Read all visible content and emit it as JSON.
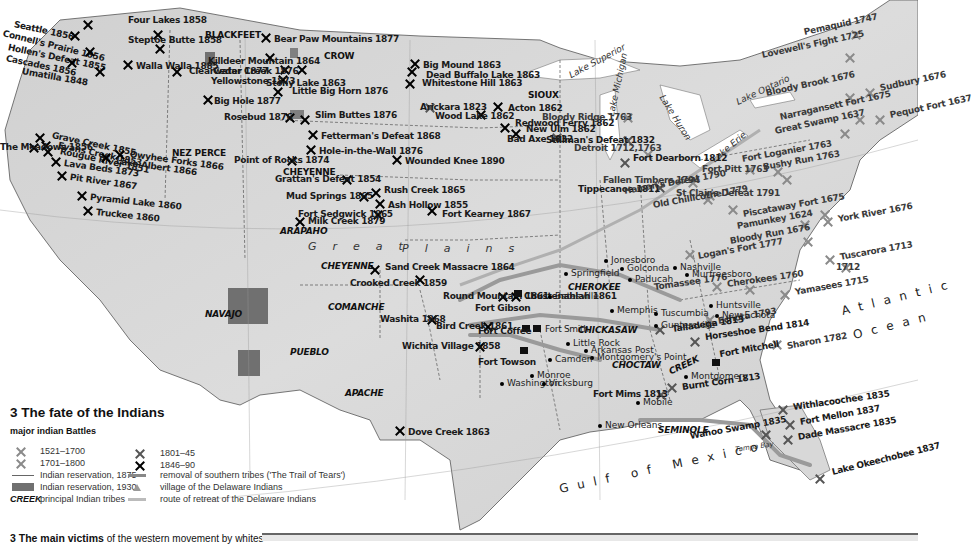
{
  "map": {
    "title": "3 The fate of the Indians",
    "colors": {
      "land": "#d9d9d9",
      "relief": "#bdbdbd",
      "reservation_1930": "#707070",
      "water": "#ffffff",
      "trail": "#9a9a9a"
    },
    "water_labels": {
      "lake_superior": "Lake Superior",
      "lake_michigan": "Lake Michigan",
      "lake_huron": "Lake Huron",
      "lake_erie": "Lake Erie",
      "lake_ontario": "Lake Ontario",
      "tampa_bay": "Tampa Bay",
      "atlantic": "Atlantic",
      "ocean": "Ocean",
      "gulf": "Gulf of Mexico",
      "great": "Great",
      "plains": "Plains"
    },
    "graticule": [
      "110°",
      "100°",
      "90°",
      "80°",
      "40°",
      "30°"
    ],
    "tribes": [
      "BLACKFEET",
      "CROW",
      "SIOUX",
      "NEZ PERCE",
      "CHEYENNE",
      "ARAPAHO",
      "CHEYENNE",
      "COMANCHE",
      "NAVAJO",
      "PUEBLO",
      "APACHE",
      "CHEROKEE",
      "CHICKASAW",
      "CHOCTAW",
      "CREEK",
      "SEMINOLE"
    ],
    "battles": [
      {
        "label": "Seattle 1856",
        "era": "1846-90"
      },
      {
        "label": "Connell's Prairie 1856",
        "era": "1846-90"
      },
      {
        "label": "Hollen's Defeat 1855",
        "era": "1846-90"
      },
      {
        "label": "Cascades 1856",
        "era": "1846-90"
      },
      {
        "label": "Umatilla 1848",
        "era": "1846-90"
      },
      {
        "label": "Four Lakes 1858",
        "era": "1846-90"
      },
      {
        "label": "Steptoe Butte 1858",
        "era": "1846-90"
      },
      {
        "label": "Walla Walla 1885",
        "era": "1846-90"
      },
      {
        "label": "Clearwater 1877",
        "era": "1846-90"
      },
      {
        "label": "Big Hole 1877",
        "era": "1846-90"
      },
      {
        "label": "Bear Paw Mountains 1877",
        "era": "1846-90"
      },
      {
        "label": "Killdeer Mountain 1864",
        "era": "1846-90"
      },
      {
        "label": "Cedar Creek 1876",
        "era": "1846-90"
      },
      {
        "label": "Yellowstone 1873",
        "era": "1846-90"
      },
      {
        "label": "Little Big Horn 1876",
        "era": "1846-90"
      },
      {
        "label": "Rosebud 1876",
        "era": "1846-90"
      },
      {
        "label": "Stony Lake 1863",
        "era": "1846-90"
      },
      {
        "label": "Big Mound 1863",
        "era": "1846-90"
      },
      {
        "label": "Dead Buffalo Lake 1863",
        "era": "1846-90"
      },
      {
        "label": "Whitestone Hill 1863",
        "era": "1846-90"
      },
      {
        "label": "Slim Buttes 1876",
        "era": "1846-90"
      },
      {
        "label": "Arickara 1823",
        "era": "1801-45"
      },
      {
        "label": "Wood Lake 1862",
        "era": "1846-90"
      },
      {
        "label": "Acton 1862",
        "era": "1846-90"
      },
      {
        "label": "Redwood Ferry 1862",
        "era": "1846-90"
      },
      {
        "label": "New Ulm 1862",
        "era": "1846-90"
      },
      {
        "label": "Fetterman's Defeat 1868",
        "era": "1846-90"
      },
      {
        "label": "Hole-in-the-Wall 1876",
        "era": "1846-90"
      },
      {
        "label": "Point of Rocks 1874",
        "era": "1846-90"
      },
      {
        "label": "Wounded Knee 1890",
        "era": "1846-90"
      },
      {
        "label": "Grattan's Defeat 1854",
        "era": "1846-90"
      },
      {
        "label": "Mud Springs 1865",
        "era": "1846-90"
      },
      {
        "label": "Rush Creek 1865",
        "era": "1846-90"
      },
      {
        "label": "Ash Hollow 1855",
        "era": "1846-90"
      },
      {
        "label": "Fort Kearney 1867",
        "era": "1846-90"
      },
      {
        "label": "Fort Sedgwick 1865",
        "era": "1846-90"
      },
      {
        "label": "Milk Creek 1879",
        "era": "1846-90"
      },
      {
        "label": "Grave Creek 1855",
        "era": "1846-90"
      },
      {
        "label": "Evans Creek 1853",
        "era": "1846-90"
      },
      {
        "label": "Rougue River 1851",
        "era": "1846-90"
      },
      {
        "label": "The Meadows 1856",
        "era": "1846-90"
      },
      {
        "label": "Owyhee Forks 1866",
        "era": "1846-90"
      },
      {
        "label": "Lake Albert 1866",
        "era": "1846-90"
      },
      {
        "label": "Lava Beds 1873",
        "era": "1846-90"
      },
      {
        "label": "Pit River 1867",
        "era": "1846-90"
      },
      {
        "label": "Pyramid Lake 1860",
        "era": "1846-90"
      },
      {
        "label": "Truckee 1860",
        "era": "1846-90"
      },
      {
        "label": "Sand Creek Massacre 1864",
        "era": "1846-90"
      },
      {
        "label": "Crooked Creek 1859",
        "era": "1846-90"
      },
      {
        "label": "Round Mountain 1861",
        "era": "1846-90"
      },
      {
        "label": "Chustenahlah 1861",
        "era": "1846-90"
      },
      {
        "label": "Washita 1868",
        "era": "1846-90"
      },
      {
        "label": "Bird Creek 1861",
        "era": "1846-90"
      },
      {
        "label": "Wichita Village 1858",
        "era": "1846-90"
      },
      {
        "label": "Dove Creek 1863",
        "era": "1846-90"
      },
      {
        "label": "Bad Axe 1832",
        "era": "1801-45"
      },
      {
        "label": "Stillman's Defeat 1832",
        "era": "1801-45"
      },
      {
        "label": "Bloody Ridge 1763",
        "era": "1701-1800"
      },
      {
        "label": "Detroit 1712,1763",
        "era": "1701-1800"
      },
      {
        "label": "Fort Dearborn 1812",
        "era": "1801-45"
      },
      {
        "label": "Tippecanoe 1811",
        "era": "1801-45"
      },
      {
        "label": "Fallen Timbers 1794",
        "era": "1701-1800"
      },
      {
        "label": "Haman's Defeat 1790",
        "era": "1701-1800"
      },
      {
        "label": "St Clair's Defeat 1791",
        "era": "1701-1800"
      },
      {
        "label": "Old Chillicothe 1779",
        "era": "1701-1800"
      },
      {
        "label": "Fort Pitt 1763",
        "era": "1701-1800"
      },
      {
        "label": "Fort Loganier 1763",
        "era": "1701-1800"
      },
      {
        "label": "Bushy Run 1763",
        "era": "1701-1800"
      },
      {
        "label": "Pemaquid 1747",
        "era": "1701-1800"
      },
      {
        "label": "Lovewell's Fight 1725",
        "era": "1701-1800"
      },
      {
        "label": "Sudbury 1676",
        "era": "1521-1700"
      },
      {
        "label": "Bloody Brook 1676",
        "era": "1521-1700"
      },
      {
        "label": "Narragansett Fort 1675",
        "era": "1521-1700"
      },
      {
        "label": "Pequot Fort 1637",
        "era": "1521-1700"
      },
      {
        "label": "Great Swamp 1637",
        "era": "1521-1700"
      },
      {
        "label": "Piscataway Fort 1675",
        "era": "1521-1700"
      },
      {
        "label": "Pamunkey 1624",
        "era": "1521-1700"
      },
      {
        "label": "York River 1676",
        "era": "1521-1700"
      },
      {
        "label": "Logan's Fort 1777",
        "era": "1701-1800"
      },
      {
        "label": "Bloody Run 1676",
        "era": "1521-1700"
      },
      {
        "label": "Tuscarora 1713",
        "era": "1701-1800"
      },
      {
        "label": "1712",
        "era": "1701-1800"
      },
      {
        "label": "Cherokees 1760",
        "era": "1701-1800"
      },
      {
        "label": "Tomassee 1776",
        "era": "1701-1800"
      },
      {
        "label": "Yamasees 1715",
        "era": "1701-1800"
      },
      {
        "label": "Echota 1793",
        "era": "1701-1800"
      },
      {
        "label": "Talladega 1813",
        "era": "1801-45"
      },
      {
        "label": "Horseshoe Bend 1814",
        "era": "1801-45"
      },
      {
        "label": "Sharon 1782",
        "era": "1701-1800"
      },
      {
        "label": "Burnt Corn 1813",
        "era": "1801-45"
      },
      {
        "label": "Fort Mims 1813",
        "era": "1801-45"
      },
      {
        "label": "Withlacoochee 1835",
        "era": "1801-45"
      },
      {
        "label": "Fort Mellon 1837",
        "era": "1801-45"
      },
      {
        "label": "Dade Massacre 1835",
        "era": "1801-45"
      },
      {
        "label": "Wahoo Swamp 1835",
        "era": "1801-45"
      },
      {
        "label": "Lake Okeechobee 1837",
        "era": "1801-45"
      }
    ],
    "forts": [
      "Fort Gibson",
      "Fort Coffee",
      "Fort Smith",
      "Fort Towson",
      "Fort Mitchell"
    ],
    "towns": [
      "Springfield",
      "Jonesboro",
      "Golconda",
      "Paducah",
      "Nashville",
      "Murfreesboro",
      "Batesville",
      "Memphis",
      "Tuscumbia",
      "Huntsville",
      "New Echota",
      "Guntersville",
      "Little Rock",
      "Arkansas Post",
      "Montgomery's Point",
      "Camden",
      "Washington",
      "Monroe",
      "Vicksburg",
      "Montgomery",
      "Mobile",
      "New Orleans"
    ]
  },
  "legend": {
    "title": "3 The fate of the Indians",
    "subtitle": "major indian Battles",
    "battle_eras": [
      {
        "label": "1521–1700",
        "shade": "#9a9a9a"
      },
      {
        "label": "1701–1800",
        "shade": "#8a8a8a"
      },
      {
        "label": "1801–45",
        "shade": "#555555"
      },
      {
        "label": "1846–90",
        "shade": "#000000"
      }
    ],
    "items": [
      {
        "symbol": "thin-line",
        "label": "Indian reservation, 1875"
      },
      {
        "symbol": "dark-fill",
        "label": "Indian reservation, 1930"
      },
      {
        "symbol": "CREEK",
        "label": "principal Indian tribes"
      },
      {
        "symbol": "arrow",
        "label": "removal of southern tribes ('The Trail of Tears')"
      },
      {
        "symbol": "triangle",
        "label": "village of the Delaware Indians"
      },
      {
        "symbol": "light-arrow",
        "label": "route of retreat of the Delaware Indians"
      }
    ]
  },
  "footer": {
    "bold": "3  The main victims",
    "rest": " of the western movement by whites"
  }
}
